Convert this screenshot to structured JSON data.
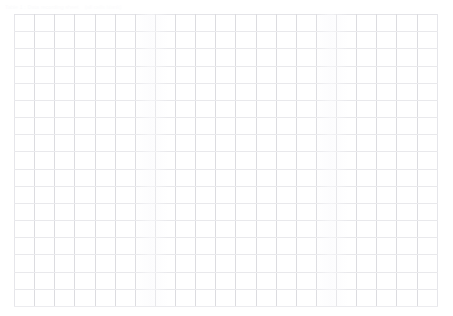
{
  "page": {
    "background_color": "#ffffff",
    "width": 453,
    "height": 316
  },
  "caption": {
    "primary": "Table 1 : Data recording sheet",
    "secondary": "(all cells blank)",
    "color": "#fbfbfc"
  },
  "grid": {
    "name": "blank-data-grid",
    "columns": 21,
    "rows": 17,
    "column_width_px": 20.14,
    "row_height_px": 17.18,
    "left_px": 14,
    "top_px": 14,
    "width_px": 423,
    "height_px": 292,
    "line_color_vertical": "#dcdce0",
    "line_color_horizontal": "#e9e9ec",
    "cell_background": "#ffffff",
    "cells": [
      [
        "",
        "",
        "",
        "",
        "",
        "",
        "",
        "",
        "",
        "",
        "",
        "",
        "",
        "",
        "",
        "",
        "",
        "",
        "",
        "",
        ""
      ],
      [
        "",
        "",
        "",
        "",
        "",
        "",
        "",
        "",
        "",
        "",
        "",
        "",
        "",
        "",
        "",
        "",
        "",
        "",
        "",
        "",
        ""
      ],
      [
        "",
        "",
        "",
        "",
        "",
        "",
        "",
        "",
        "",
        "",
        "",
        "",
        "",
        "",
        "",
        "",
        "",
        "",
        "",
        "",
        ""
      ],
      [
        "",
        "",
        "",
        "",
        "",
        "",
        "",
        "",
        "",
        "",
        "",
        "",
        "",
        "",
        "",
        "",
        "",
        "",
        "",
        "",
        ""
      ],
      [
        "",
        "",
        "",
        "",
        "",
        "",
        "",
        "",
        "",
        "",
        "",
        "",
        "",
        "",
        "",
        "",
        "",
        "",
        "",
        "",
        ""
      ],
      [
        "",
        "",
        "",
        "",
        "",
        "",
        "",
        "",
        "",
        "",
        "",
        "",
        "",
        "",
        "",
        "",
        "",
        "",
        "",
        "",
        ""
      ],
      [
        "",
        "",
        "",
        "",
        "",
        "",
        "",
        "",
        "",
        "",
        "",
        "",
        "",
        "",
        "",
        "",
        "",
        "",
        "",
        "",
        ""
      ],
      [
        "",
        "",
        "",
        "",
        "",
        "",
        "",
        "",
        "",
        "",
        "",
        "",
        "",
        "",
        "",
        "",
        "",
        "",
        "",
        "",
        ""
      ],
      [
        "",
        "",
        "",
        "",
        "",
        "",
        "",
        "",
        "",
        "",
        "",
        "",
        "",
        "",
        "",
        "",
        "",
        "",
        "",
        "",
        ""
      ],
      [
        "",
        "",
        "",
        "",
        "",
        "",
        "",
        "",
        "",
        "",
        "",
        "",
        "",
        "",
        "",
        "",
        "",
        "",
        "",
        "",
        ""
      ],
      [
        "",
        "",
        "",
        "",
        "",
        "",
        "",
        "",
        "",
        "",
        "",
        "",
        "",
        "",
        "",
        "",
        "",
        "",
        "",
        "",
        ""
      ],
      [
        "",
        "",
        "",
        "",
        "",
        "",
        "",
        "",
        "",
        "",
        "",
        "",
        "",
        "",
        "",
        "",
        "",
        "",
        "",
        "",
        ""
      ],
      [
        "",
        "",
        "",
        "",
        "",
        "",
        "",
        "",
        "",
        "",
        "",
        "",
        "",
        "",
        "",
        "",
        "",
        "",
        "",
        "",
        ""
      ],
      [
        "",
        "",
        "",
        "",
        "",
        "",
        "",
        "",
        "",
        "",
        "",
        "",
        "",
        "",
        "",
        "",
        "",
        "",
        "",
        "",
        ""
      ],
      [
        "",
        "",
        "",
        "",
        "",
        "",
        "",
        "",
        "",
        "",
        "",
        "",
        "",
        "",
        "",
        "",
        "",
        "",
        "",
        "",
        ""
      ],
      [
        "",
        "",
        "",
        "",
        "",
        "",
        "",
        "",
        "",
        "",
        "",
        "",
        "",
        "",
        "",
        "",
        "",
        "",
        "",
        "",
        ""
      ],
      [
        "",
        "",
        "",
        "",
        "",
        "",
        "",
        "",
        "",
        "",
        "",
        "",
        "",
        "",
        "",
        "",
        "",
        "",
        "",
        "",
        ""
      ]
    ]
  }
}
